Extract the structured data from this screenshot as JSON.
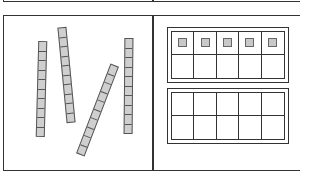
{
  "diagram": {
    "colors": {
      "stroke": "#333333",
      "rod_fill": "#cfcfcf",
      "counter_fill": "#c8c8c8"
    },
    "left_panel": {
      "rods": [
        {
          "id": "rod-1",
          "units": 10,
          "cx": 41,
          "cy": 89,
          "rotate": 1.5
        },
        {
          "id": "rod-2",
          "units": 10,
          "cx": 66,
          "cy": 75,
          "rotate": -5.5
        },
        {
          "id": "rod-3",
          "units": 10,
          "cx": 97,
          "cy": 110,
          "rotate": 21
        },
        {
          "id": "rod-4",
          "units": 10,
          "cx": 128,
          "cy": 86,
          "rotate": 0.5
        }
      ]
    },
    "right_panel": {
      "ten_frames": [
        {
          "id": "ten-frame-1",
          "rows": 2,
          "cols": 5,
          "filled": [
            true,
            true,
            true,
            true,
            true,
            false,
            false,
            false,
            false,
            false
          ]
        },
        {
          "id": "ten-frame-2",
          "rows": 2,
          "cols": 5,
          "filled": [
            false,
            false,
            false,
            false,
            false,
            false,
            false,
            false,
            false,
            false
          ]
        }
      ]
    }
  }
}
